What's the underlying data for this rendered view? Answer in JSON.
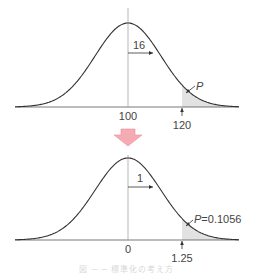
{
  "chart_data": [
    {
      "type": "area",
      "title": "Normal distribution N(100, 16^2)",
      "mean": 100,
      "sd": 16,
      "mean_label": "100",
      "sd_label": "16",
      "cutoff_label": "120",
      "cutoff": 120,
      "shaded_region": "x >= 120",
      "area_label": "P",
      "grid": false
    },
    {
      "type": "area",
      "title": "Standard normal distribution N(0, 1)",
      "mean": 0,
      "sd": 1,
      "mean_label": "0",
      "sd_label": "1",
      "cutoff_label": "1.25",
      "cutoff": 1.25,
      "shaded_region": "z >= 1.25",
      "area_label": "P=0.1056",
      "probability": 0.1056,
      "grid": false
    }
  ],
  "transform_arrow": {
    "direction": "down",
    "color": "#f4a0a8"
  },
  "colors": {
    "curve": "#333333",
    "shade": "#dddddd",
    "axis": "#555555"
  },
  "caption": "図 ─ ─ 標準化の考え方"
}
